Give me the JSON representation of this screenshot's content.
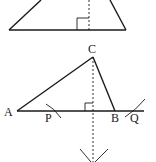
{
  "diagram": {
    "type": "geometry-construction",
    "colors": {
      "stroke": "#1a1a1a",
      "background": "#ffffff"
    },
    "labels": {
      "C": "C",
      "A": "A",
      "P": "P",
      "B": "B",
      "Q": "Q"
    },
    "top_figure": {
      "shape": "triangle (partially cropped) with dashed altitude and right-angle mark"
    },
    "bottom_figure": {
      "shape": "triangle ABC with dashed perpendicular from C to line AB, arcs at P, Q and below line"
    }
  }
}
